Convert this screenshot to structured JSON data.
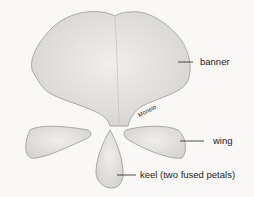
{
  "diagram": {
    "labels": {
      "banner": "banner",
      "wing": "wing",
      "keel": "keel (two fused petals)"
    },
    "signature": "Moneio",
    "colors": {
      "petal_fill": "#e4e3e1",
      "petal_edge": "#9a9894",
      "background": "#f9f8f6",
      "text": "#222222"
    }
  }
}
